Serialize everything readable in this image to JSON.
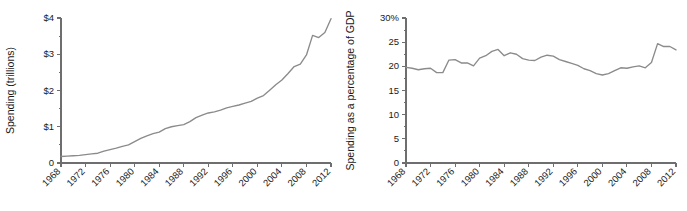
{
  "figure": {
    "background_color": "#ffffff",
    "line_color": "#8b8b8b",
    "axis_color": "#6e6e6e",
    "text_color": "#1a1a1a"
  },
  "chart_data": [
    {
      "id": "spending-trillions",
      "type": "line",
      "title": "",
      "subtitle": "",
      "xlabel": "",
      "ylabel": "Spending (trillions)",
      "xlim": [
        1968,
        2012
      ],
      "ylim": [
        0,
        4
      ],
      "grid": false,
      "legend": false,
      "y_tick_labels": [
        "$4",
        "$3",
        "$2",
        "$1",
        "0"
      ],
      "y_tick_values": [
        4,
        3,
        2,
        1,
        0
      ],
      "y_minor_ticks": [
        0.5,
        1.5,
        2.5,
        3.5
      ],
      "x_tick_labels": [
        "1968",
        "1972",
        "1976",
        "1980",
        "1984",
        "1988",
        "1992",
        "1996",
        "2000",
        "2004",
        "2008",
        "2012"
      ],
      "x_tick_values": [
        1968,
        1972,
        1976,
        1980,
        1984,
        1988,
        1992,
        1996,
        2000,
        2004,
        2008,
        2012
      ],
      "x": [
        1968,
        1969,
        1970,
        1971,
        1972,
        1973,
        1974,
        1975,
        1976,
        1977,
        1978,
        1979,
        1980,
        1981,
        1982,
        1983,
        1984,
        1985,
        1986,
        1987,
        1988,
        1989,
        1990,
        1991,
        1992,
        1993,
        1994,
        1995,
        1996,
        1997,
        1998,
        1999,
        2000,
        2001,
        2002,
        2003,
        2004,
        2005,
        2006,
        2007,
        2008,
        2009,
        2010,
        2011,
        2012
      ],
      "values": [
        0.18,
        0.19,
        0.2,
        0.21,
        0.23,
        0.25,
        0.27,
        0.33,
        0.37,
        0.41,
        0.46,
        0.5,
        0.59,
        0.68,
        0.75,
        0.81,
        0.85,
        0.95,
        1.0,
        1.03,
        1.06,
        1.14,
        1.25,
        1.32,
        1.38,
        1.41,
        1.46,
        1.52,
        1.56,
        1.6,
        1.65,
        1.7,
        1.79,
        1.86,
        2.01,
        2.16,
        2.29,
        2.47,
        2.66,
        2.73,
        2.98,
        3.52,
        3.46,
        3.6,
        3.98
      ]
    },
    {
      "id": "spending-pct-gdp",
      "type": "line",
      "title": "",
      "subtitle": "",
      "xlabel": "",
      "ylabel": "Spending as a percentage of GDP",
      "xlim": [
        1968,
        2012
      ],
      "ylim": [
        0,
        30
      ],
      "grid": false,
      "legend": false,
      "y_tick_labels": [
        "30%",
        "25",
        "20",
        "15",
        "10",
        "5",
        "0"
      ],
      "y_tick_values": [
        30,
        25,
        20,
        15,
        10,
        5,
        0
      ],
      "y_minor_ticks": [
        2.5,
        7.5,
        12.5,
        17.5,
        22.5,
        27.5
      ],
      "x_tick_labels": [
        "1968",
        "1972",
        "1976",
        "1980",
        "1984",
        "1988",
        "1992",
        "1996",
        "2000",
        "2004",
        "2008",
        "2012"
      ],
      "x_tick_values": [
        1968,
        1972,
        1976,
        1980,
        1984,
        1988,
        1992,
        1996,
        2000,
        2004,
        2008,
        2012
      ],
      "x": [
        1968,
        1969,
        1970,
        1971,
        1972,
        1973,
        1974,
        1975,
        1976,
        1977,
        1978,
        1979,
        1980,
        1981,
        1982,
        1983,
        1984,
        1985,
        1986,
        1987,
        1988,
        1989,
        1990,
        1991,
        1992,
        1993,
        1994,
        1995,
        1996,
        1997,
        1998,
        1999,
        2000,
        2001,
        2002,
        2003,
        2004,
        2005,
        2006,
        2007,
        2008,
        2009,
        2010,
        2011,
        2012
      ],
      "values": [
        19.8,
        19.6,
        19.3,
        19.5,
        19.6,
        18.7,
        18.7,
        21.3,
        21.4,
        20.7,
        20.7,
        20.1,
        21.7,
        22.2,
        23.1,
        23.5,
        22.2,
        22.8,
        22.5,
        21.6,
        21.3,
        21.2,
        21.9,
        22.3,
        22.1,
        21.4,
        21.0,
        20.6,
        20.2,
        19.5,
        19.1,
        18.5,
        18.2,
        18.5,
        19.1,
        19.7,
        19.6,
        19.9,
        20.1,
        19.7,
        20.8,
        24.7,
        24.1,
        24.1,
        23.4
      ]
    }
  ]
}
